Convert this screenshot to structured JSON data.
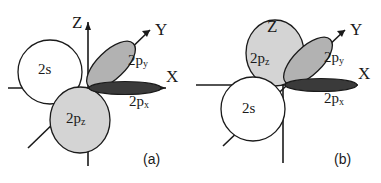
{
  "figure": {
    "colors": {
      "background": "#ffffff",
      "stroke": "#1a1a1a",
      "lobe_py_fill": "#b2b2b2",
      "lobe_pz_fill": "#d4d4d4",
      "lobe_px_fill": "#3a3a3a",
      "s_fill": "#ffffff"
    },
    "panels": [
      {
        "id": "a",
        "caption": "(a)",
        "axes": [
          {
            "name": "z-axis",
            "label": "Z"
          },
          {
            "name": "y-axis",
            "label": "Y"
          },
          {
            "name": "x-axis",
            "label": "X"
          }
        ],
        "orbitals": [
          {
            "name": "s-orbital",
            "label": "2s",
            "sub": "",
            "fill": "#ffffff"
          },
          {
            "name": "py-orbital",
            "label": "2p",
            "sub": "y",
            "fill": "#b2b2b2"
          },
          {
            "name": "px-orbital",
            "label": "2p",
            "sub": "x",
            "fill": "#3a3a3a"
          },
          {
            "name": "pz-orbital",
            "label": "2p",
            "sub": "z",
            "fill": "#d4d4d4"
          }
        ]
      },
      {
        "id": "b",
        "caption": "(b)",
        "axes": [
          {
            "name": "z-axis",
            "label": "Z"
          },
          {
            "name": "y-axis",
            "label": "Y"
          },
          {
            "name": "x-axis",
            "label": "X"
          }
        ],
        "orbitals": [
          {
            "name": "pz-orbital",
            "label": "2p",
            "sub": "z",
            "fill": "#d4d4d4"
          },
          {
            "name": "py-orbital",
            "label": "2p",
            "sub": "y",
            "fill": "#b2b2b2"
          },
          {
            "name": "px-orbital",
            "label": "2p",
            "sub": "x",
            "fill": "#3a3a3a"
          },
          {
            "name": "s-orbital",
            "label": "2s",
            "sub": "",
            "fill": "#ffffff"
          }
        ]
      }
    ]
  }
}
